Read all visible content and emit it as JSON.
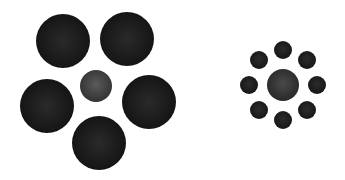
{
  "figure": {
    "left_cluster": {
      "center": {
        "cx": 96,
        "cy": 86,
        "r": 16,
        "color": "#3f3f3f"
      },
      "surround": [
        {
          "cx": 63,
          "cy": 41,
          "r": 27
        },
        {
          "cx": 127,
          "cy": 39,
          "r": 27
        },
        {
          "cx": 47,
          "cy": 106,
          "r": 27
        },
        {
          "cx": 149,
          "cy": 102,
          "r": 27
        },
        {
          "cx": 99,
          "cy": 143,
          "r": 27
        }
      ],
      "surround_color": "#161616"
    },
    "right_cluster": {
      "center": {
        "cx": 283,
        "cy": 85,
        "r": 16,
        "color": "#333333"
      },
      "surround": [
        {
          "cx": 283,
          "cy": 50,
          "r": 9
        },
        {
          "cx": 259,
          "cy": 60,
          "r": 9
        },
        {
          "cx": 307,
          "cy": 60,
          "r": 9
        },
        {
          "cx": 249,
          "cy": 85,
          "r": 9
        },
        {
          "cx": 317,
          "cy": 85,
          "r": 9
        },
        {
          "cx": 259,
          "cy": 110,
          "r": 9
        },
        {
          "cx": 307,
          "cy": 110,
          "r": 9
        },
        {
          "cx": 283,
          "cy": 120,
          "r": 9
        }
      ],
      "surround_color": "#161616"
    }
  }
}
